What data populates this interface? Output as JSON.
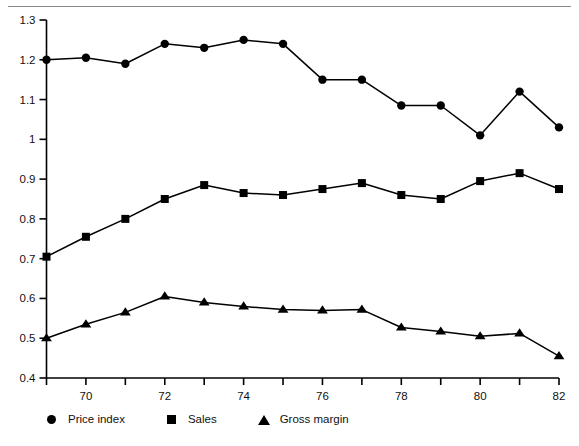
{
  "chart_data": {
    "type": "line",
    "title": "",
    "subtitle": "",
    "xlabel": "",
    "ylabel": "",
    "xlim": [
      68.7,
      82
    ],
    "ylim": [
      0.4,
      1.3
    ],
    "grid": false,
    "legend_position": "bottom-left",
    "x": [
      69,
      70,
      71,
      72,
      73,
      74,
      75,
      76,
      77,
      78,
      79,
      80,
      81,
      82
    ],
    "xtick_values": [
      69,
      70,
      71,
      72,
      73,
      74,
      75,
      76,
      77,
      78,
      79,
      80,
      81,
      82
    ],
    "xtick_labels": [
      "",
      "70",
      "",
      "72",
      "",
      "74",
      "",
      "76",
      "",
      "78",
      "",
      "80",
      "",
      "82"
    ],
    "ytick_values": [
      0.4,
      0.5,
      0.6,
      0.7,
      0.8,
      0.9,
      1.0,
      1.1,
      1.2,
      1.3
    ],
    "ytick_labels": [
      "0.4",
      "0.5",
      "0.6",
      "0.7",
      "0.8",
      "0.9",
      "1",
      "1.1",
      "1.2",
      "1.3"
    ],
    "series": [
      {
        "name": "Price index",
        "marker": "circle",
        "color": "#000000",
        "values": [
          1.2,
          1.205,
          1.19,
          1.24,
          1.23,
          1.25,
          1.24,
          1.15,
          1.15,
          1.085,
          1.085,
          1.01,
          1.12,
          1.03
        ]
      },
      {
        "name": "Sales",
        "marker": "square",
        "color": "#000000",
        "values": [
          0.705,
          0.755,
          0.8,
          0.85,
          0.885,
          0.865,
          0.86,
          0.875,
          0.89,
          0.86,
          0.85,
          0.895,
          0.915,
          0.875
        ]
      },
      {
        "name": "Gross margin",
        "marker": "triangle",
        "color": "#000000",
        "values": [
          0.5,
          0.535,
          0.565,
          0.605,
          0.59,
          0.58,
          0.572,
          0.57,
          0.572,
          0.527,
          0.517,
          0.505,
          0.512,
          0.455
        ]
      }
    ]
  },
  "legend": {
    "items": [
      {
        "label": "Price index",
        "marker": "circle"
      },
      {
        "label": "Sales",
        "marker": "square"
      },
      {
        "label": "Gross margin",
        "marker": "triangle"
      }
    ]
  }
}
